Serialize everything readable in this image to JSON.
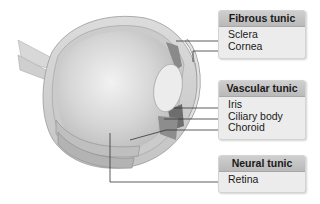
{
  "diagram": {
    "groups": [
      {
        "title": "Fibrous tunic",
        "items": [
          "Sclera",
          "Cornea"
        ]
      },
      {
        "title": "Vascular tunic",
        "items": [
          "Iris",
          "Ciliary body",
          "Choroid"
        ]
      },
      {
        "title": "Neural tunic",
        "items": [
          "Retina"
        ]
      }
    ]
  }
}
